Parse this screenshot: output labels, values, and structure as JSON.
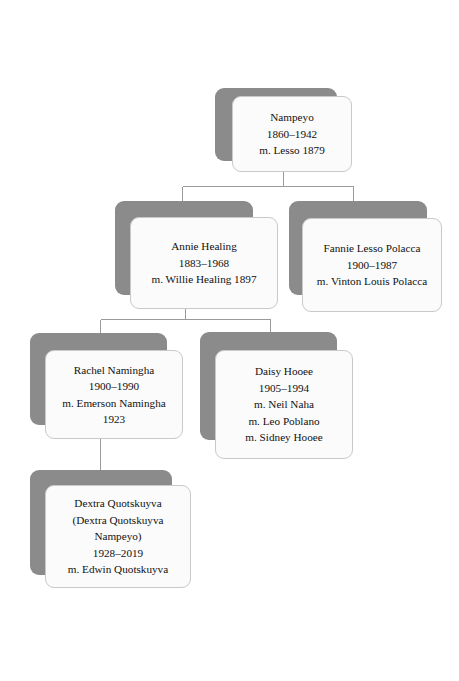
{
  "diagram": {
    "type": "genealogy-tree",
    "background_color": "#ffffff",
    "card_fill_color": "#fbfbfb",
    "card_border_color": "#c9c9c9",
    "shadow_color": "#8b8b8b",
    "connector_color": "#9a9a9a",
    "text_color": "#111111"
  },
  "nodes": {
    "nampeyo": {
      "name": "Nampeyo",
      "lines": [
        "Nampeyo",
        "1860–1942",
        "m. Lesso 1879"
      ]
    },
    "annie_healing": {
      "name": "Annie Healing",
      "lines": [
        "Annie Healing",
        "1883–1968",
        "m. Willie Healing 1897"
      ]
    },
    "fannie_lesso_polacca": {
      "name": "Fannie Lesso Polacca",
      "lines": [
        "Fannie Lesso Polacca",
        "1900–1987",
        "m. Vinton Louis Polacca"
      ]
    },
    "rachel_namingha": {
      "name": "Rachel Namingha",
      "lines": [
        "Rachel Namingha",
        "1900–1990",
        "m. Emerson Namingha",
        "1923"
      ]
    },
    "daisy_hooee": {
      "name": "Daisy Hooee",
      "lines": [
        "Daisy Hooee",
        "1905–1994",
        "m. Neil Naha",
        "m. Leo Poblano",
        "m. Sidney Hooee"
      ]
    },
    "dextra_quotskuyva": {
      "name": "Dextra Quotskuyva",
      "lines": [
        "Dextra Quotskuyva",
        "(Dextra Quotskuyva",
        "Nampeyo)",
        "1928–2019",
        "m. Edwin Quotskuyva"
      ]
    }
  }
}
